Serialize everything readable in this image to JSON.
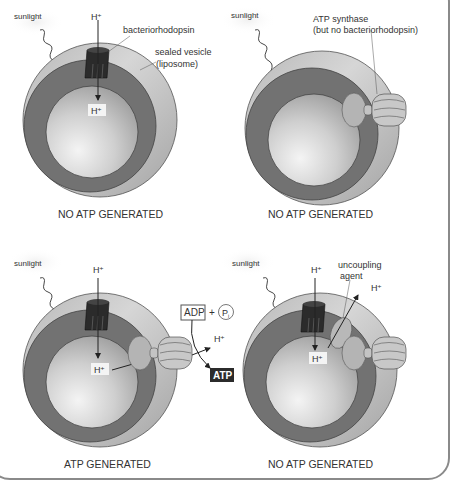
{
  "figure": {
    "colors": {
      "outer_membrane": "#c9c9c9",
      "outer_shadow": "#a8a8a8",
      "dark_ring": "#6f6f6f",
      "inner_sphere_light": "#e8e8e8",
      "inner_sphere_dark": "#a0a0a0",
      "pump": "#2a2a2a",
      "synthase": "#bdbdbd",
      "frame": "#8a8a8a"
    },
    "panels": [
      {
        "id": "panel-1",
        "sunlight": "sunlight",
        "proton_outside": "H⁺",
        "proton_inside": "H⁺",
        "label_pump": "bacteriorhodopsin",
        "label_vesicle_line1": "sealed vesicle",
        "label_vesicle_line2": "(liposome)",
        "caption": "NO ATP GENERATED"
      },
      {
        "id": "panel-2",
        "sunlight": "sunlight",
        "label_synthase_line1": "ATP synthase",
        "label_synthase_line2": "(but no bacteriorhodopsin)",
        "caption": "NO ATP GENERATED"
      },
      {
        "id": "panel-3",
        "sunlight": "sunlight",
        "proton_outside": "H⁺",
        "proton_inside": "H⁺",
        "proton_out_synthase": "H⁺",
        "adp": "ADP",
        "plus": "+",
        "pi": "P",
        "pi_sub": "i",
        "atp": "ATP",
        "caption": "ATP GENERATED"
      },
      {
        "id": "panel-4",
        "sunlight": "sunlight",
        "proton_outside": "H⁺",
        "proton_inside": "H⁺",
        "proton_leak": "H⁺",
        "label_uncoupler_line1": "uncoupling",
        "label_uncoupler_line2": "agent",
        "caption": "NO ATP GENERATED"
      }
    ]
  }
}
